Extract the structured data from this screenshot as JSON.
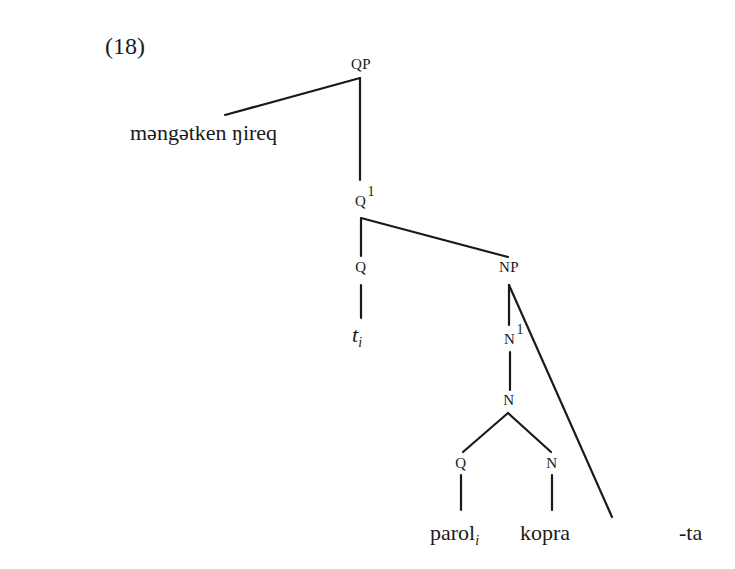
{
  "example_number": "(18)",
  "nodes": {
    "qp": "QP",
    "q1": "Q",
    "q1_bar": "1",
    "q": "Q",
    "np": "NP",
    "n1": "N",
    "n1_bar": "1",
    "n": "N",
    "q_low": "Q",
    "n_low": "N"
  },
  "leaves": {
    "specifier": "məngətken ŋireq",
    "trace": "t",
    "trace_index": "i",
    "parol": "parol",
    "parol_index": "i",
    "kopra": "kopra",
    "suffix": "-ta"
  }
}
